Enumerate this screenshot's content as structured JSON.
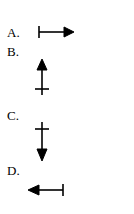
{
  "figure": {
    "background_color": "#ffffff",
    "ink_color": "#000000",
    "width": 134,
    "height": 214,
    "options": [
      {
        "label": "A.",
        "icon": "arrow-right-with-tail-tick-icon",
        "direction": "right",
        "tick": "vertical tick at tail (left end)"
      },
      {
        "label": "B.",
        "icon": "arrow-up-with-tail-crossbar-icon",
        "direction": "up",
        "tick": "horizontal crossbar near tail (bottom)"
      },
      {
        "label": "C.",
        "icon": "arrow-down-with-tail-crossbar-icon",
        "direction": "down",
        "tick": "horizontal crossbar near tail (top)"
      },
      {
        "label": "D.",
        "icon": "arrow-left-with-tail-tick-icon",
        "direction": "left",
        "tick": "vertical tick at tail (right end)"
      }
    ]
  }
}
